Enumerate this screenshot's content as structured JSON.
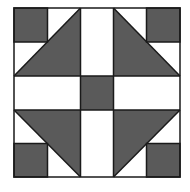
{
  "diagram": {
    "type": "quilt-block",
    "colors": {
      "dark": "#5a5a5a",
      "light": "#ffffff",
      "stroke": "#1a1a1a",
      "background": "#ffffff"
    },
    "bounds": {
      "x": 14,
      "y": 8,
      "width": 166,
      "height": 169
    },
    "grid_x": [
      14,
      47.5,
      80.5,
      113.5,
      146.5,
      180
    ],
    "grid_y": [
      8,
      42,
      76,
      110,
      143.5,
      177
    ],
    "pieces": [
      {
        "name": "corner-square-top-left",
        "fill": "dark"
      },
      {
        "name": "corner-square-top-right",
        "fill": "dark"
      },
      {
        "name": "corner-square-bottom-left",
        "fill": "dark"
      },
      {
        "name": "corner-square-bottom-right",
        "fill": "dark"
      },
      {
        "name": "triangle-top-left",
        "fill": "dark"
      },
      {
        "name": "triangle-top-right",
        "fill": "dark"
      },
      {
        "name": "triangle-bottom-left",
        "fill": "dark"
      },
      {
        "name": "triangle-bottom-right",
        "fill": "dark"
      },
      {
        "name": "center-square",
        "fill": "dark"
      },
      {
        "name": "strip-top",
        "fill": "light"
      },
      {
        "name": "strip-bottom",
        "fill": "light"
      },
      {
        "name": "strip-left",
        "fill": "light"
      },
      {
        "name": "strip-right",
        "fill": "light"
      }
    ]
  }
}
